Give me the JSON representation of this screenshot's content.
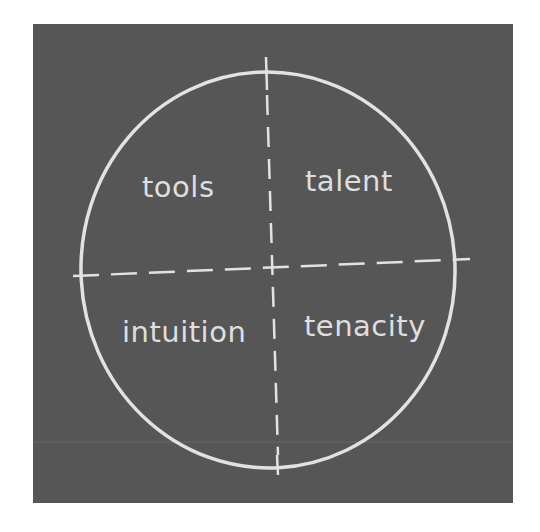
{
  "diagram": {
    "type": "quadrant-circle",
    "colors": {
      "background": "#ffffff",
      "board": "#565656",
      "chalk": "#dedede"
    },
    "quadrants": [
      {
        "position": "top-left",
        "label": "tools"
      },
      {
        "position": "top-right",
        "label": "talent"
      },
      {
        "position": "bottom-left",
        "label": "intuition"
      },
      {
        "position": "bottom-right",
        "label": "tenacity"
      }
    ]
  }
}
